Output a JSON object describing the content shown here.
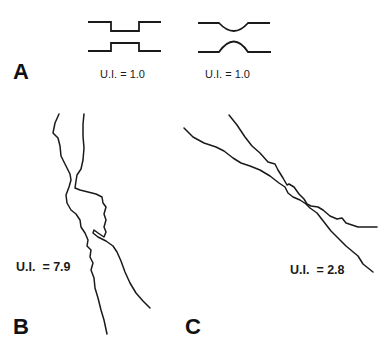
{
  "figure": {
    "panels": [
      {
        "letter": "A",
        "schematics": [
          {
            "shape": "rectangular-constriction",
            "label": "U.I. = 1.0"
          },
          {
            "shape": "rounded-constriction",
            "label": "U.I. = 1.0"
          }
        ]
      },
      {
        "letter": "B",
        "description": "irregular two-wall trace with tortuous narrowing",
        "label": "U.I.  = 7.9"
      },
      {
        "letter": "C",
        "description": "crossing wavy two-wall trace, diagonal",
        "label": "U.I.  = 2.8"
      }
    ]
  }
}
